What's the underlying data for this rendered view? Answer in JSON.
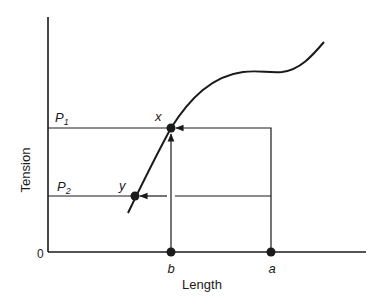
{
  "diagram": {
    "y_axis_label": "Tension",
    "x_axis_label": "Length",
    "origin_label": "0",
    "y_levels": [
      {
        "label": "P",
        "subscript": "1",
        "point": "x"
      },
      {
        "label": "P",
        "subscript": "2",
        "point": "y"
      }
    ],
    "x_marks": [
      {
        "label": "b"
      },
      {
        "label": "a"
      }
    ],
    "points": {
      "x": "x",
      "y": "y"
    },
    "colors": {
      "ink": "#1a1a1a",
      "background": "#ffffff"
    }
  }
}
